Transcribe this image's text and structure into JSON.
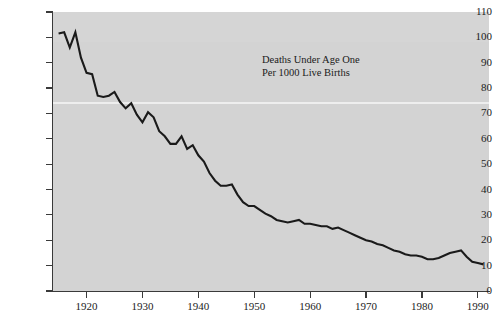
{
  "figure": {
    "background_color": "#ffffff",
    "panel_color": "#d3d3d3",
    "line_color": "#1a1a1a",
    "axis_color": "#3a3a3a",
    "text_color": "#1c1c1c"
  },
  "annotation": {
    "line1": "Deaths Under Age One",
    "line2": "Per 1000 Live Births"
  },
  "axes": {
    "y_ticks": [
      0,
      10,
      20,
      30,
      40,
      50,
      60,
      70,
      80,
      90,
      100,
      110
    ],
    "y_tick_labels": [
      "0",
      "10",
      "20",
      "30",
      "40",
      "50",
      "60",
      "70",
      "80",
      "90",
      "100",
      "110"
    ],
    "x_ticks": [
      1920,
      1930,
      1940,
      1950,
      1960,
      1970,
      1980,
      1990
    ],
    "x_tick_labels": [
      "1920",
      "1930",
      "1940",
      "1950",
      "1960",
      "1970",
      "1980",
      "1990"
    ]
  },
  "chart_data": {
    "type": "line",
    "title": "",
    "subtitle": "",
    "xlabel": "",
    "ylabel": "",
    "annotations": [
      "Deaths Under Age One",
      "Per 1000 Live Births"
    ],
    "xlim": [
      1914,
      1992
    ],
    "ylim": [
      0,
      110
    ],
    "grid": false,
    "legend": "none",
    "series": [
      {
        "name": "Deaths Under Age One Per 1000 Live Births",
        "color": "#1a1a1a",
        "x": [
          1915,
          1916,
          1917,
          1918,
          1919,
          1920,
          1921,
          1922,
          1923,
          1924,
          1925,
          1926,
          1927,
          1928,
          1929,
          1930,
          1931,
          1932,
          1933,
          1934,
          1935,
          1936,
          1937,
          1938,
          1939,
          1940,
          1941,
          1942,
          1943,
          1944,
          1945,
          1946,
          1947,
          1948,
          1949,
          1950,
          1951,
          1952,
          1953,
          1954,
          1955,
          1956,
          1957,
          1958,
          1959,
          1960,
          1961,
          1962,
          1963,
          1964,
          1965,
          1966,
          1967,
          1968,
          1969,
          1970,
          1971,
          1972,
          1973,
          1974,
          1975,
          1976,
          1977,
          1978,
          1979,
          1980,
          1981,
          1982,
          1983,
          1984,
          1985,
          1986,
          1987,
          1988,
          1989,
          1990,
          1991
        ],
        "y": [
          101.5,
          102.0,
          96.0,
          102.0,
          92.0,
          86.0,
          85.5,
          77.0,
          76.5,
          77.0,
          78.5,
          74.5,
          72.0,
          74.0,
          69.5,
          66.5,
          70.5,
          68.5,
          63.0,
          61.0,
          58.0,
          58.0,
          61.0,
          56.0,
          57.5,
          53.5,
          51.0,
          46.5,
          43.5,
          41.5,
          41.5,
          42.0,
          38.0,
          35.0,
          33.5,
          33.5,
          32.0,
          30.5,
          29.5,
          28.0,
          27.5,
          27.0,
          27.5,
          28.0,
          26.5,
          26.5,
          26.0,
          25.5,
          25.5,
          24.5,
          25.0,
          24.0,
          23.0,
          22.0,
          21.0,
          20.0,
          19.5,
          18.5,
          18.0,
          17.0,
          16.0,
          15.5,
          14.5,
          14.0,
          14.0,
          13.5,
          12.5,
          12.5,
          13.0,
          14.0,
          15.0,
          15.5,
          16.0,
          13.5,
          11.5,
          11.0,
          10.5
        ]
      }
    ]
  }
}
